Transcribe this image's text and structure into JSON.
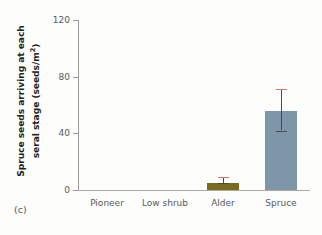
{
  "panel": {
    "letter": "(c)"
  },
  "chart_data": {
    "type": "bar",
    "title": "",
    "subtitle": "",
    "xlabel": "",
    "ylabel": "Spruce seeds arriving at each seral stage  (seeds/m²)",
    "ylabel_line1": "Spruce seeds arriving at each",
    "ylabel_line2_pre": "seral stage  (seeds/m",
    "ylabel_line2_sup": "2",
    "ylabel_line2_post": ")",
    "categories": [
      "Pioneer",
      "Low shrub",
      "Alder",
      "Spruce"
    ],
    "values": [
      0,
      0,
      5,
      56
    ],
    "errors_low": [
      0,
      0,
      5,
      42
    ],
    "errors_high": [
      0,
      0,
      9,
      71
    ],
    "ylim": [
      0,
      120
    ],
    "yticks": [
      0,
      40,
      80,
      120
    ],
    "ytick_labels": [
      "0",
      "40",
      "80",
      "120"
    ],
    "grid": false,
    "legend": "none",
    "bar_colors": [
      "#7a6a1e",
      "#7a6a1e",
      "#7a6a1e",
      "#7d97a8"
    ],
    "error_color": "#4a4a4a",
    "error_cap_top_color": "#c9737a",
    "axis_color": "#9a9a98",
    "text_color": "#58595b"
  }
}
